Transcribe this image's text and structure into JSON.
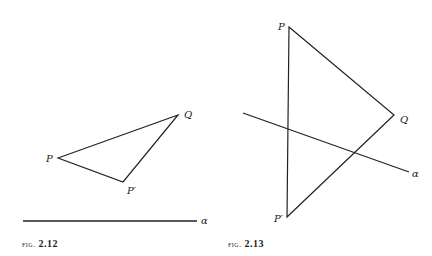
{
  "figures": [
    {
      "caption_prefix": "fig.",
      "caption_number": "2.12",
      "points": {
        "P": {
          "label": "P",
          "x": 58,
          "y": 158
        },
        "Q": {
          "label": "Q",
          "x": 178,
          "y": 115
        },
        "Pp": {
          "label": "P′",
          "x": 123,
          "y": 182
        }
      },
      "line_alpha": {
        "label": "α",
        "x1": 23,
        "y1": 221,
        "x2": 197,
        "y2": 221
      }
    },
    {
      "caption_prefix": "fig.",
      "caption_number": "2.13",
      "points": {
        "P": {
          "label": "P",
          "x": 289,
          "y": 27
        },
        "Q": {
          "label": "Q",
          "x": 394,
          "y": 115
        },
        "Pp": {
          "label": "P′",
          "x": 287,
          "y": 217
        }
      },
      "line_alpha": {
        "label": "α",
        "x1": 243,
        "y1": 113,
        "x2": 409,
        "y2": 172
      }
    }
  ]
}
